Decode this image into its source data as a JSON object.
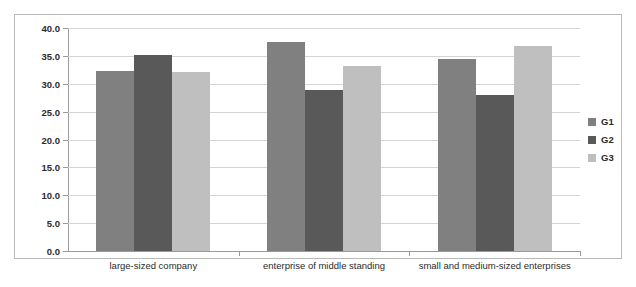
{
  "chart_data": {
    "type": "bar",
    "title": "",
    "subtitle": "",
    "xlabel": "",
    "ylabel": "",
    "categories": [
      "large-sized company",
      "enterprise of middle standing",
      "small and medium-sized enterprises"
    ],
    "series": [
      {
        "name": "G1",
        "color": "#808080",
        "values": [
          32.3,
          37.5,
          34.5
        ]
      },
      {
        "name": "G2",
        "color": "#595959",
        "values": [
          35.2,
          28.9,
          28.0
        ]
      },
      {
        "name": "G3",
        "color": "#bfbfbf",
        "values": [
          32.2,
          33.2,
          36.8
        ]
      }
    ],
    "ylim": [
      0.0,
      40.0
    ],
    "ytick_step": 5.0,
    "ytick_labels": [
      "0.0",
      "5.0",
      "10.0",
      "15.0",
      "20.0",
      "25.0",
      "30.0",
      "35.0",
      "40.0"
    ],
    "grid": true,
    "grid_axis": "y",
    "legend": {
      "position": "right",
      "entries": [
        {
          "label": "G1",
          "color": "#808080"
        },
        {
          "label": "G2",
          "color": "#595959"
        },
        {
          "label": "G3",
          "color": "#bfbfbf"
        }
      ]
    },
    "colors": {
      "background": "#ffffff",
      "frame_border": "#b9b9b9",
      "gridline": "#d4d4d4",
      "axis": "#9a9a9a",
      "text": "#2b2b2b"
    }
  }
}
